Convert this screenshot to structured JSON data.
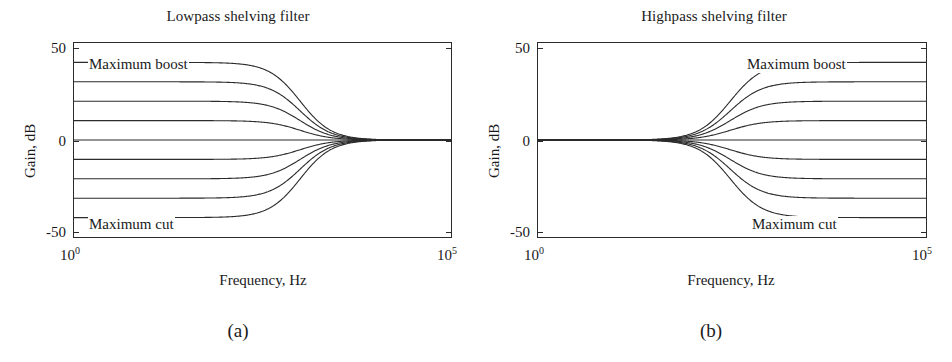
{
  "figure": {
    "caption_a": "(a)",
    "caption_b": "(b)",
    "line_color": "#2b2b2b",
    "axis_color": "#2b2b2b",
    "background": "#ffffff"
  },
  "panels": [
    {
      "id": "a",
      "title": "Lowpass shelving filter",
      "xlabel": "Frequency, Hz",
      "ylabel": "Gain, dB",
      "annotation_boost": "Maximum boost",
      "annotation_cut": "Maximum cut",
      "ytick_labels": [
        "50",
        "0",
        "-50"
      ],
      "xtick_labels": [
        "10",
        "10"
      ],
      "xtick_exponents": [
        "0",
        "5"
      ]
    },
    {
      "id": "b",
      "title": "Highpass shelving filter",
      "xlabel": "Frequency, Hz",
      "ylabel": "Gain, dB",
      "annotation_boost": "Maximum boost",
      "annotation_cut": "Maximum cut",
      "ytick_labels": [
        "50",
        "0",
        "-50"
      ],
      "xtick_labels": [
        "10",
        "10"
      ],
      "xtick_exponents": [
        "0",
        "5"
      ]
    }
  ],
  "chart_data": [
    {
      "type": "line",
      "title": "Lowpass shelving filter",
      "xlabel": "Frequency, Hz",
      "ylabel": "Gain, dB",
      "xscale": "log",
      "xlim": [
        1,
        100000
      ],
      "ylim": [
        -50,
        50
      ],
      "yticks": [
        -50,
        0,
        50
      ],
      "xticks": [
        1,
        100000
      ],
      "xtick_labels": [
        "10^0",
        "10^5"
      ],
      "grid": false,
      "legend": "none",
      "annotations": [
        {
          "text": "Maximum boost",
          "x": 2,
          "y": 44
        },
        {
          "text": "Maximum cut",
          "x": 2,
          "y": -45
        }
      ],
      "description": "Lowpass shelving filter family: gain is flat at the shelf level for low frequencies and rolls off to 0 dB above the transition frequency near 1 kHz.",
      "shelf_gains_db": [
        40,
        30,
        20,
        10,
        -10,
        -20,
        -30,
        -40
      ],
      "transition_hz": 1000,
      "series": [
        {
          "name": "+40 dB (maximum boost)",
          "low_freq_gain_db": 40,
          "high_freq_gain_db": 0
        },
        {
          "name": "+30 dB",
          "low_freq_gain_db": 30,
          "high_freq_gain_db": 0
        },
        {
          "name": "+20 dB",
          "low_freq_gain_db": 20,
          "high_freq_gain_db": 0
        },
        {
          "name": "+10 dB",
          "low_freq_gain_db": 10,
          "high_freq_gain_db": 0
        },
        {
          "name": "-10 dB",
          "low_freq_gain_db": -10,
          "high_freq_gain_db": 0
        },
        {
          "name": "-20 dB",
          "low_freq_gain_db": -20,
          "high_freq_gain_db": 0
        },
        {
          "name": "-30 dB",
          "low_freq_gain_db": -30,
          "high_freq_gain_db": 0
        },
        {
          "name": "-40 dB (maximum cut)",
          "low_freq_gain_db": -40,
          "high_freq_gain_db": 0
        }
      ]
    },
    {
      "type": "line",
      "title": "Highpass shelving filter",
      "xlabel": "Frequency, Hz",
      "ylabel": "Gain, dB",
      "xscale": "log",
      "xlim": [
        1,
        100000
      ],
      "ylim": [
        -50,
        50
      ],
      "yticks": [
        -50,
        0,
        50
      ],
      "xticks": [
        1,
        100000
      ],
      "xtick_labels": [
        "10^0",
        "10^5"
      ],
      "grid": false,
      "legend": "none",
      "annotations": [
        {
          "text": "Maximum boost",
          "x": 1000,
          "y": 44
        },
        {
          "text": "Maximum cut",
          "x": 1000,
          "y": -45
        }
      ],
      "description": "Highpass shelving filter family: gain is 0 dB at low frequencies and rises (or falls) to the shelf level above the transition frequency near 300 Hz.",
      "shelf_gains_db": [
        40,
        30,
        20,
        10,
        -10,
        -20,
        -30,
        -40
      ],
      "transition_hz": 300,
      "series": [
        {
          "name": "+40 dB (maximum boost)",
          "low_freq_gain_db": 0,
          "high_freq_gain_db": 40
        },
        {
          "name": "+30 dB",
          "low_freq_gain_db": 0,
          "high_freq_gain_db": 30
        },
        {
          "name": "+20 dB",
          "low_freq_gain_db": 0,
          "high_freq_gain_db": 20
        },
        {
          "name": "+10 dB",
          "low_freq_gain_db": 0,
          "high_freq_gain_db": 10
        },
        {
          "name": "-10 dB",
          "low_freq_gain_db": 0,
          "high_freq_gain_db": -10
        },
        {
          "name": "-20 dB",
          "low_freq_gain_db": 0,
          "high_freq_gain_db": -20
        },
        {
          "name": "-30 dB",
          "low_freq_gain_db": 0,
          "high_freq_gain_db": -30
        },
        {
          "name": "-40 dB (maximum cut)",
          "low_freq_gain_db": 0,
          "high_freq_gain_db": -40
        }
      ]
    }
  ]
}
